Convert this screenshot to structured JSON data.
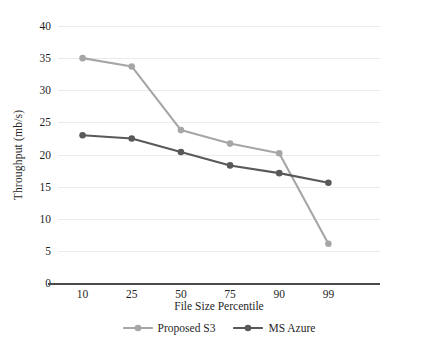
{
  "chart_data": {
    "type": "line",
    "title": "",
    "xlabel": "File Size Percentile",
    "ylabel": "Throughput (mb/s)",
    "categories": [
      "10",
      "25",
      "50",
      "75",
      "90",
      "99"
    ],
    "xtick_labels": [
      "10",
      "25",
      "50",
      "75",
      "90",
      "99"
    ],
    "ytick_labels": [
      "0",
      "5",
      "10",
      "15",
      "20",
      "25",
      "30",
      "35",
      "40"
    ],
    "ytick_values": [
      0,
      5,
      10,
      15,
      20,
      25,
      30,
      35,
      40
    ],
    "ylim": [
      0,
      40
    ],
    "grid": "horizontal",
    "legend_position": "bottom-center",
    "series": [
      {
        "name": "Proposed S3",
        "color": "#a6a6a6",
        "marker": "circle",
        "values": [
          35.0,
          33.7,
          23.8,
          21.7,
          20.2,
          6.1
        ]
      },
      {
        "name": "MS Azure",
        "color": "#595959",
        "marker": "circle",
        "values": [
          23.0,
          22.5,
          20.4,
          18.3,
          17.1,
          15.6
        ]
      }
    ]
  },
  "colors": {
    "proposed_s3": "#a6a6a6",
    "ms_azure": "#595959",
    "gridline": "#eceaea",
    "axis": "#4a4a4a",
    "text": "#1f1f1f",
    "background": "#ffffff"
  }
}
